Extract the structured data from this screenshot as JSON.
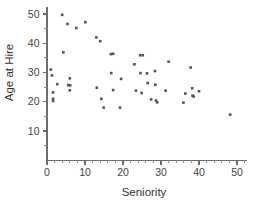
{
  "chart_data": {
    "type": "scatter",
    "title": "",
    "xlabel": "Seniority",
    "ylabel": "Age at Hire",
    "xlim": [
      0,
      52
    ],
    "ylim": [
      0,
      52
    ],
    "xticks": [
      0,
      10,
      20,
      30,
      40,
      50
    ],
    "xtick_labels": [
      "0",
      "10",
      "20",
      "30",
      "40",
      "50"
    ],
    "x_minor_tick_step": 2,
    "yticks": [
      10,
      20,
      30,
      40,
      50
    ],
    "ytick_labels": [
      "10",
      "20",
      "30",
      "40",
      "50"
    ],
    "y_minor_tick_step": 5,
    "grid": false,
    "legend": null,
    "marker": "square",
    "marker_color": "#555555",
    "axis_color": "#6d6d6d",
    "points": [
      {
        "x": 1.0,
        "y": 31.0
      },
      {
        "x": 1.3,
        "y": 29.0
      },
      {
        "x": 1.6,
        "y": 23.2
      },
      {
        "x": 1.6,
        "y": 21.0
      },
      {
        "x": 1.6,
        "y": 20.3
      },
      {
        "x": 2.7,
        "y": 26.0
      },
      {
        "x": 4.0,
        "y": 49.7
      },
      {
        "x": 4.3,
        "y": 36.9
      },
      {
        "x": 5.4,
        "y": 46.6
      },
      {
        "x": 5.6,
        "y": 25.7
      },
      {
        "x": 6.0,
        "y": 28.0
      },
      {
        "x": 6.1,
        "y": 25.6
      },
      {
        "x": 6.0,
        "y": 23.9
      },
      {
        "x": 7.7,
        "y": 45.2
      },
      {
        "x": 10.1,
        "y": 47.2
      },
      {
        "x": 13.0,
        "y": 42.0
      },
      {
        "x": 13.1,
        "y": 24.8
      },
      {
        "x": 14.0,
        "y": 40.7
      },
      {
        "x": 14.3,
        "y": 21.0
      },
      {
        "x": 14.9,
        "y": 18.0
      },
      {
        "x": 16.8,
        "y": 36.3
      },
      {
        "x": 17.4,
        "y": 36.4
      },
      {
        "x": 16.9,
        "y": 29.8
      },
      {
        "x": 17.4,
        "y": 24.0
      },
      {
        "x": 19.2,
        "y": 18.0
      },
      {
        "x": 19.5,
        "y": 27.8
      },
      {
        "x": 23.0,
        "y": 32.8
      },
      {
        "x": 23.4,
        "y": 23.8
      },
      {
        "x": 24.5,
        "y": 35.9
      },
      {
        "x": 25.2,
        "y": 35.9
      },
      {
        "x": 24.6,
        "y": 29.8
      },
      {
        "x": 24.9,
        "y": 23.0
      },
      {
        "x": 26.3,
        "y": 29.7
      },
      {
        "x": 26.5,
        "y": 26.4
      },
      {
        "x": 27.4,
        "y": 20.8
      },
      {
        "x": 28.4,
        "y": 30.5
      },
      {
        "x": 28.5,
        "y": 25.8
      },
      {
        "x": 28.7,
        "y": 20.4
      },
      {
        "x": 29.0,
        "y": 19.8
      },
      {
        "x": 31.2,
        "y": 23.8
      },
      {
        "x": 32.0,
        "y": 33.7
      },
      {
        "x": 35.9,
        "y": 19.7
      },
      {
        "x": 36.4,
        "y": 22.8
      },
      {
        "x": 37.8,
        "y": 31.7
      },
      {
        "x": 38.2,
        "y": 24.6
      },
      {
        "x": 38.3,
        "y": 22.1
      },
      {
        "x": 38.6,
        "y": 21.8
      },
      {
        "x": 40.0,
        "y": 23.6
      },
      {
        "x": 48.2,
        "y": 15.6
      }
    ]
  }
}
